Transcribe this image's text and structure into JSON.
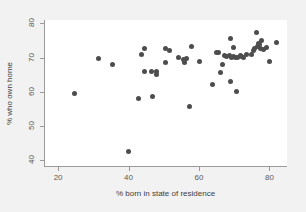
{
  "chart_data": {
    "type": "scatter",
    "title": "",
    "xlabel": "% born in state of residence",
    "ylabel": "% who own home",
    "xlim": [
      16,
      85
    ],
    "ylim": [
      38,
      81
    ],
    "xticks": [
      20,
      40,
      60,
      80
    ],
    "yticks": [
      40,
      50,
      60,
      70,
      80
    ],
    "grid": false,
    "legend": null,
    "marker": {
      "shape": "circle",
      "color": "#4d4d4d",
      "size_px": 5
    },
    "points": [
      {
        "x": 24.3,
        "y": 59.5
      },
      {
        "x": 31.2,
        "y": 69.7
      },
      {
        "x": 35.2,
        "y": 67.9
      },
      {
        "x": 39.8,
        "y": 42.5
      },
      {
        "x": 42.6,
        "y": 58.1
      },
      {
        "x": 43.4,
        "y": 70.9
      },
      {
        "x": 44.2,
        "y": 72.6
      },
      {
        "x": 44.3,
        "y": 65.8
      },
      {
        "x": 46.3,
        "y": 66.0
      },
      {
        "x": 46.5,
        "y": 58.7
      },
      {
        "x": 47.6,
        "y": 65.9
      },
      {
        "x": 47.8,
        "y": 65.2
      },
      {
        "x": 50.1,
        "y": 72.8
      },
      {
        "x": 50.3,
        "y": 68.7
      },
      {
        "x": 51.4,
        "y": 72.2
      },
      {
        "x": 53.8,
        "y": 70.0
      },
      {
        "x": 55.2,
        "y": 69.3
      },
      {
        "x": 55.5,
        "y": 68.6
      },
      {
        "x": 56.2,
        "y": 69.7
      },
      {
        "x": 57.1,
        "y": 55.8
      },
      {
        "x": 57.6,
        "y": 73.2
      },
      {
        "x": 59.9,
        "y": 68.8
      },
      {
        "x": 63.7,
        "y": 62.2
      },
      {
        "x": 64.6,
        "y": 71.4
      },
      {
        "x": 65.4,
        "y": 71.6
      },
      {
        "x": 65.9,
        "y": 65.6
      },
      {
        "x": 66.5,
        "y": 67.9
      },
      {
        "x": 67.0,
        "y": 70.5
      },
      {
        "x": 67.6,
        "y": 70.3
      },
      {
        "x": 68.3,
        "y": 70.7
      },
      {
        "x": 68.6,
        "y": 75.5
      },
      {
        "x": 68.7,
        "y": 63.0
      },
      {
        "x": 69.0,
        "y": 70.1
      },
      {
        "x": 69.4,
        "y": 70.2
      },
      {
        "x": 69.6,
        "y": 73.1
      },
      {
        "x": 70.1,
        "y": 70.0
      },
      {
        "x": 70.4,
        "y": 60.2
      },
      {
        "x": 70.6,
        "y": 69.9
      },
      {
        "x": 71.4,
        "y": 70.6
      },
      {
        "x": 71.8,
        "y": 70.4
      },
      {
        "x": 72.4,
        "y": 70.1
      },
      {
        "x": 73.1,
        "y": 70.8
      },
      {
        "x": 74.6,
        "y": 71.0
      },
      {
        "x": 75.2,
        "y": 72.0
      },
      {
        "x": 75.6,
        "y": 72.6
      },
      {
        "x": 76.0,
        "y": 77.2
      },
      {
        "x": 76.2,
        "y": 73.2
      },
      {
        "x": 76.6,
        "y": 74.0
      },
      {
        "x": 77.0,
        "y": 73.8
      },
      {
        "x": 77.3,
        "y": 72.8
      },
      {
        "x": 77.6,
        "y": 75.0
      },
      {
        "x": 78.1,
        "y": 72.5
      },
      {
        "x": 79.0,
        "y": 73.0
      },
      {
        "x": 79.8,
        "y": 68.8
      },
      {
        "x": 81.7,
        "y": 74.5
      }
    ]
  }
}
